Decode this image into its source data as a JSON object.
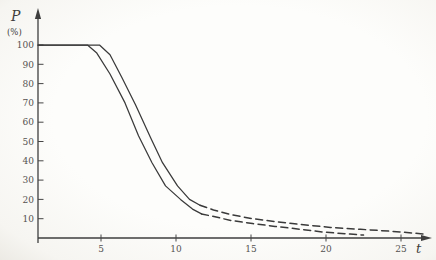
{
  "figure": {
    "background_color": "#fdfdfb",
    "line_color": "#3a3a3a",
    "text_color": "#555250"
  },
  "chart_data": {
    "type": "line",
    "title": "",
    "xlabel": "t",
    "ylabel": "P (%)",
    "ylabel_symbol": "P",
    "ylabel_unit": "(%)",
    "xlim": [
      0,
      27
    ],
    "ylim": [
      0,
      105
    ],
    "xticks": [
      5,
      10,
      15,
      20,
      25
    ],
    "yticks": [
      10,
      20,
      30,
      40,
      50,
      60,
      70,
      80,
      90,
      100
    ],
    "grid": false,
    "legend_position": "none",
    "series": [
      {
        "name": "curve-1-earlier-drop",
        "line_style": "solid then dashed tail",
        "solid_points": [
          [
            0.8,
            100
          ],
          [
            4.1,
            100
          ],
          [
            4.7,
            96
          ],
          [
            5.6,
            85
          ],
          [
            6.6,
            70
          ],
          [
            7.5,
            53
          ],
          [
            8.4,
            39
          ],
          [
            9.3,
            27
          ],
          [
            10.3,
            20
          ],
          [
            11.1,
            15
          ],
          [
            11.7,
            12.5
          ]
        ],
        "dashed_points": [
          [
            11.7,
            12.5
          ],
          [
            12.6,
            11
          ],
          [
            13.7,
            9
          ],
          [
            15.1,
            7.5
          ],
          [
            16.6,
            6
          ],
          [
            18.3,
            4.5
          ],
          [
            19.9,
            3
          ],
          [
            21.6,
            2
          ],
          [
            22.5,
            1.5
          ]
        ]
      },
      {
        "name": "curve-2-later-drop",
        "line_style": "solid then dashed tail",
        "solid_points": [
          [
            0.8,
            100
          ],
          [
            4.9,
            100
          ],
          [
            5.6,
            95
          ],
          [
            6.4,
            83
          ],
          [
            7.3,
            69
          ],
          [
            8.3,
            52
          ],
          [
            9.1,
            39
          ],
          [
            10.1,
            27
          ],
          [
            10.9,
            20
          ],
          [
            11.6,
            17
          ]
        ],
        "dashed_points": [
          [
            11.6,
            17
          ],
          [
            12.5,
            14.5
          ],
          [
            13.7,
            12
          ],
          [
            15.1,
            10
          ],
          [
            16.6,
            8.5
          ],
          [
            18.3,
            7
          ],
          [
            20.3,
            5.5
          ],
          [
            22.3,
            4.5
          ],
          [
            24.3,
            3.5
          ],
          [
            25.9,
            2.5
          ],
          [
            26.6,
            2
          ]
        ]
      }
    ]
  }
}
